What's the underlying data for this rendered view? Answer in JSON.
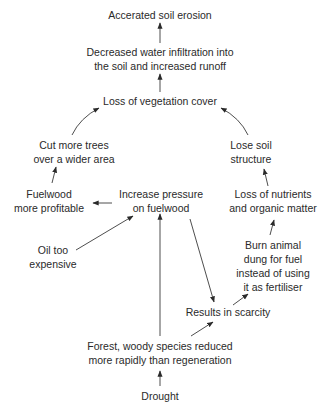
{
  "diagram": {
    "type": "flow-causal-diagram",
    "nodes": [
      {
        "id": "erosion",
        "lines": [
          "Accerated soil erosion"
        ]
      },
      {
        "id": "infiltration",
        "lines": [
          "Decreased water infiltration into",
          "the soil and increased runoff"
        ]
      },
      {
        "id": "vegetation",
        "lines": [
          "Loss of vegetation cover"
        ]
      },
      {
        "id": "cut_trees",
        "lines": [
          "Cut more trees",
          "over a wider area"
        ]
      },
      {
        "id": "soil_structure",
        "lines": [
          "Lose soil",
          "structure"
        ]
      },
      {
        "id": "fuelwood_profitable",
        "lines": [
          "Fuelwood",
          "more profitable"
        ]
      },
      {
        "id": "pressure",
        "lines": [
          "Increase pressure",
          "on fuelwood"
        ]
      },
      {
        "id": "nutrients",
        "lines": [
          "Loss of nutrients",
          "and organic matter"
        ]
      },
      {
        "id": "oil",
        "lines": [
          "Oil too",
          "expensive"
        ]
      },
      {
        "id": "dung",
        "lines": [
          "Burn animal",
          "dung for fuel",
          "instead of using",
          "it as fertiliser"
        ]
      },
      {
        "id": "scarcity",
        "lines": [
          "Results in scarcity"
        ]
      },
      {
        "id": "forest",
        "lines": [
          "Forest, woody species reduced",
          "more rapidly than regeneration"
        ]
      },
      {
        "id": "drought",
        "lines": [
          "Drought"
        ]
      }
    ],
    "edges": [
      {
        "from": "infiltration",
        "to": "erosion"
      },
      {
        "from": "vegetation",
        "to": "infiltration"
      },
      {
        "from": "cut_trees",
        "to": "vegetation"
      },
      {
        "from": "soil_structure",
        "to": "vegetation"
      },
      {
        "from": "fuelwood_profitable",
        "to": "cut_trees"
      },
      {
        "from": "pressure",
        "to": "fuelwood_profitable"
      },
      {
        "from": "oil",
        "to": "pressure"
      },
      {
        "from": "forest",
        "to": "pressure"
      },
      {
        "from": "pressure",
        "to": "scarcity"
      },
      {
        "from": "forest",
        "to": "scarcity"
      },
      {
        "from": "scarcity",
        "to": "dung"
      },
      {
        "from": "dung",
        "to": "nutrients"
      },
      {
        "from": "nutrients",
        "to": "soil_structure"
      },
      {
        "from": "drought",
        "to": "forest"
      }
    ]
  },
  "labels": {
    "erosion_l1": "Accerated soil erosion",
    "infiltration_l1": "Decreased water infiltration into",
    "infiltration_l2": "the soil and increased runoff",
    "vegetation_l1": "Loss of vegetation cover",
    "cut_trees_l1": "Cut more trees",
    "cut_trees_l2": "over a wider area",
    "soil_structure_l1": "Lose soil",
    "soil_structure_l2": "structure",
    "fuelwood_l1": "Fuelwood",
    "fuelwood_l2": "more profitable",
    "pressure_l1": "Increase pressure",
    "pressure_l2": "on fuelwood",
    "nutrients_l1": "Loss of nutrients",
    "nutrients_l2": "and organic matter",
    "oil_l1": "Oil too",
    "oil_l2": "expensive",
    "dung_l1": "Burn animal",
    "dung_l2": "dung for fuel",
    "dung_l3": "instead of using",
    "dung_l4": "it as fertiliser",
    "scarcity_l1": "Results in scarcity",
    "forest_l1": "Forest, woody species reduced",
    "forest_l2": "more rapidly than regeneration",
    "drought_l1": "Drought"
  }
}
